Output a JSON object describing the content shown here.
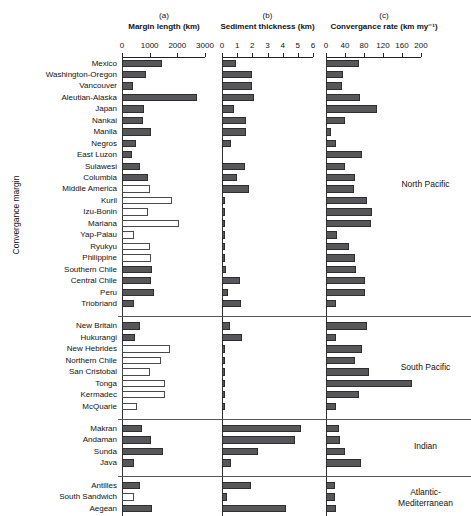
{
  "figure": {
    "y_axis_title": "Convergance margin",
    "panels": [
      {
        "id": "a",
        "letter": "(a)",
        "title": "Margin length (km)",
        "min": 0,
        "max": 3000,
        "ticks": [
          0,
          1000,
          2000,
          3000
        ],
        "ticklabels": [
          "0",
          "1000",
          "2000",
          "3000"
        ]
      },
      {
        "id": "b",
        "letter": "(b)",
        "title": "Sediment thickness (km)",
        "min": 0,
        "max": 6,
        "ticks": [
          0,
          1,
          2,
          3,
          4,
          5,
          6
        ],
        "ticklabels": [
          "0",
          "1",
          "2",
          "3",
          "4",
          "5",
          "6"
        ]
      },
      {
        "id": "c",
        "letter": "(c)",
        "title": "Convergance rate (km my⁻¹)",
        "min": 0,
        "max": 200,
        "ticks": [
          0,
          40,
          80,
          120,
          160,
          200
        ],
        "ticklabels": [
          "0",
          "40",
          "80",
          "120",
          "160",
          "200"
        ]
      }
    ],
    "groups": [
      {
        "name": "North Pacific",
        "label_lines": [
          "North Pacific"
        ]
      },
      {
        "name": "South Pacific",
        "label_lines": [
          "South Pacific"
        ]
      },
      {
        "name": "Indian",
        "label_lines": [
          "Indian"
        ]
      },
      {
        "name": "Atlantic-Mediterranean",
        "label_lines": [
          "Atlantic-",
          "Mediterranean"
        ]
      }
    ]
  },
  "chart_data": {
    "type": "bar",
    "orientation": "horizontal",
    "grid": false,
    "legend_position": "none",
    "ylabel": "Convergance margin",
    "panels": [
      {
        "key": "margin_length",
        "letter": "(a)",
        "xlabel": "Margin length (km)",
        "unit": "km",
        "xlim": [
          0,
          3000
        ],
        "xticks": [
          0,
          1000,
          2000,
          3000
        ]
      },
      {
        "key": "sediment_thickness",
        "letter": "(b)",
        "xlabel": "Sediment thickness (km)",
        "unit": "km",
        "xlim": [
          0,
          6
        ],
        "xticks": [
          0,
          1,
          2,
          3,
          4,
          5,
          6
        ]
      },
      {
        "key": "convergance_rate",
        "letter": "(c)",
        "xlabel": "Convergance rate (km my⁻¹)",
        "unit": "km my-1",
        "xlim": [
          0,
          200
        ],
        "xticks": [
          0,
          40,
          80,
          120,
          160,
          200
        ]
      }
    ],
    "categories": [
      "Mexico",
      "Washington-Oregon",
      "Vancouver",
      "Aleutian-Alaska",
      "Japan",
      "Nankai",
      "Manila",
      "Negros",
      "East Luzon",
      "Sulawesi",
      "Columbia",
      "Middle America",
      "Kuril",
      "Izu-Bonin",
      "Mariana",
      "Yap-Palau",
      "Ryukyu",
      "Philippine",
      "Southern Chile",
      "Central Chile",
      "Peru",
      "Triobriand",
      "New Britain",
      "Hukurangi",
      "New Hebrides",
      "Northern Chile",
      "San Cristobal",
      "Tonga",
      "Kermadec",
      "McQuarie",
      "Makran",
      "Andaman",
      "Sunda",
      "Java",
      "Antilles",
      "South Sandwich",
      "Aegean"
    ],
    "group_of_category": [
      "North Pacific",
      "North Pacific",
      "North Pacific",
      "North Pacific",
      "North Pacific",
      "North Pacific",
      "North Pacific",
      "North Pacific",
      "North Pacific",
      "North Pacific",
      "North Pacific",
      "North Pacific",
      "North Pacific",
      "North Pacific",
      "North Pacific",
      "North Pacific",
      "North Pacific",
      "North Pacific",
      "North Pacific",
      "North Pacific",
      "North Pacific",
      "North Pacific",
      "South Pacific",
      "South Pacific",
      "South Pacific",
      "South Pacific",
      "South Pacific",
      "South Pacific",
      "South Pacific",
      "South Pacific",
      "Indian",
      "Indian",
      "Indian",
      "Indian",
      "Atlantic-Mediterranean",
      "Atlantic-Mediterranean",
      "Atlantic-Mediterranean"
    ],
    "series": [
      {
        "name": "Margin length (km)",
        "key": "margin_length",
        "values": [
          1450,
          870,
          400,
          2700,
          800,
          760,
          1060,
          520,
          360,
          640,
          930,
          1010,
          1800,
          950,
          2060,
          440,
          1000,
          1040,
          1080,
          1060,
          1150,
          430,
          640,
          470,
          1750,
          1400,
          1020,
          1560,
          1550,
          560,
          740,
          1050,
          1480,
          420,
          660,
          430,
          1080
        ],
        "fill": [
          "filled",
          "filled",
          "filled",
          "filled",
          "filled",
          "filled",
          "filled",
          "filled",
          "filled",
          "filled",
          "filled",
          "open",
          "open",
          "open",
          "open",
          "open",
          "open",
          "open",
          "filled",
          "filled",
          "filled",
          "filled",
          "filled",
          "filled",
          "open",
          "open",
          "open",
          "open",
          "open",
          "open",
          "filled",
          "filled",
          "filled",
          "filled",
          "filled",
          "open",
          "filled"
        ]
      },
      {
        "name": "Sediment thickness (km)",
        "key": "sediment_thickness",
        "values": [
          0.9,
          2.0,
          2.0,
          2.1,
          0.8,
          1.6,
          1.6,
          0.6,
          0.0,
          1.5,
          1.0,
          1.8,
          0.2,
          0.2,
          0.2,
          0.2,
          0.2,
          0.2,
          0.25,
          1.2,
          0.4,
          1.25,
          0.55,
          1.35,
          0.2,
          0.2,
          0.2,
          0.2,
          0.2,
          0.2,
          5.2,
          4.8,
          2.4,
          0.6,
          1.9,
          0.35,
          4.2
        ],
        "fill": [
          "filled",
          "filled",
          "filled",
          "filled",
          "filled",
          "filled",
          "filled",
          "filled",
          "filled",
          "filled",
          "filled",
          "filled",
          "filled",
          "filled",
          "filled",
          "filled",
          "filled",
          "filled",
          "filled",
          "filled",
          "filled",
          "filled",
          "filled",
          "filled",
          "filled",
          "filled",
          "filled",
          "filled",
          "filled",
          "filled",
          "filled",
          "filled",
          "filled",
          "filled",
          "filled",
          "filled",
          "filled"
        ]
      },
      {
        "name": "Convergance rate (km my-1)",
        "key": "convergance_rate",
        "values": [
          70,
          36,
          34,
          72,
          108,
          40,
          10,
          22,
          76,
          40,
          62,
          58,
          86,
          96,
          94,
          24,
          48,
          60,
          64,
          82,
          82,
          22,
          86,
          22,
          76,
          62,
          90,
          180,
          70,
          22,
          28,
          30,
          40,
          74,
          18,
          18,
          20
        ],
        "fill": [
          "filled",
          "filled",
          "filled",
          "filled",
          "filled",
          "filled",
          "filled",
          "filled",
          "filled",
          "filled",
          "filled",
          "filled",
          "filled",
          "filled",
          "filled",
          "filled",
          "filled",
          "filled",
          "filled",
          "filled",
          "filled",
          "filled",
          "filled",
          "filled",
          "filled",
          "filled",
          "filled",
          "filled",
          "filled",
          "filled",
          "filled",
          "filled",
          "filled",
          "filled",
          "filled",
          "filled",
          "filled"
        ]
      }
    ]
  }
}
